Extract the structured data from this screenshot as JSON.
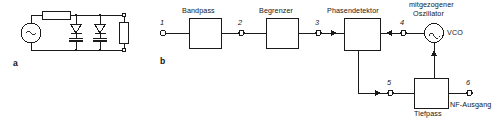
{
  "figure": {
    "panel_a": {
      "key": "a",
      "components": {
        "ac_source": "ac-source",
        "series_resistor": "resistor",
        "diode_1": "diode",
        "diode_2": "diode",
        "capacitor_1": "capacitor",
        "capacitor_2": "capacitor",
        "load_resistor": "resistor",
        "terminal_top": "terminal",
        "terminal_bottom": "terminal"
      }
    },
    "panel_b": {
      "key": "b",
      "blocks": [
        {
          "id": "bandpass",
          "label": "Bandpass"
        },
        {
          "id": "begrenzer",
          "label": "Begrenzer"
        },
        {
          "id": "phasendetektor",
          "label": "Phasendetektor"
        },
        {
          "id": "tiefpass",
          "label": "Tiefpass"
        }
      ],
      "oscillator": {
        "caption_line1": "mitgezogener",
        "caption_line2": "Oszillator",
        "abbrev": "VCO"
      },
      "output_label": "NF-Ausgang",
      "nodes": [
        {
          "n": "1"
        },
        {
          "n": "2"
        },
        {
          "n": "3"
        },
        {
          "n": "4"
        },
        {
          "n": "5"
        },
        {
          "n": "6"
        }
      ]
    }
  },
  "colors": {
    "line": "#1a1a1a",
    "background": "#ffffff"
  }
}
